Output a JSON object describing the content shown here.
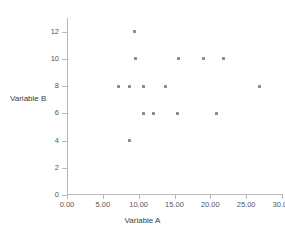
{
  "chart_data": {
    "type": "scatter",
    "title": "",
    "xlabel": "Variable A",
    "ylabel": "Variable B",
    "xlim": [
      0,
      30
    ],
    "ylim": [
      0,
      13
    ],
    "xticks": [
      0,
      5,
      10,
      15,
      20,
      25,
      30
    ],
    "xtick_labels": [
      "0.00",
      "5.00",
      "10.00",
      "15.00",
      "20.00",
      "25.00",
      "30.00"
    ],
    "yticks": [
      0,
      2,
      4,
      6,
      8,
      10,
      12
    ],
    "ytick_labels": [
      "0",
      "2",
      "4",
      "6",
      "8",
      "10",
      "12"
    ],
    "grid": false,
    "legend": null,
    "marker_color": "#8d8d91",
    "axis_color": "#b9b9b9",
    "points": [
      {
        "x": 9.4,
        "y": 12
      },
      {
        "x": 9.6,
        "y": 10
      },
      {
        "x": 15.6,
        "y": 10
      },
      {
        "x": 19.1,
        "y": 10
      },
      {
        "x": 21.9,
        "y": 10
      },
      {
        "x": 7.2,
        "y": 8
      },
      {
        "x": 8.7,
        "y": 8
      },
      {
        "x": 10.7,
        "y": 8
      },
      {
        "x": 13.7,
        "y": 8
      },
      {
        "x": 26.9,
        "y": 8
      },
      {
        "x": 10.7,
        "y": 6
      },
      {
        "x": 12.1,
        "y": 6
      },
      {
        "x": 15.4,
        "y": 6
      },
      {
        "x": 20.9,
        "y": 6
      },
      {
        "x": 8.7,
        "y": 4
      }
    ]
  }
}
